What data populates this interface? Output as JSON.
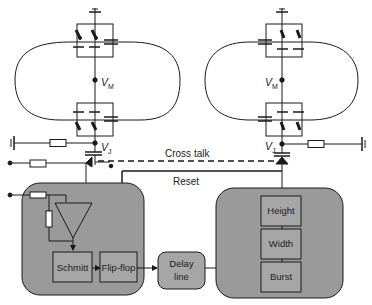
{
  "diagram": {
    "colors": {
      "line": "#1a1a1a",
      "panel_fill": "#9a9a9a",
      "block_fill": "#a6a6a6",
      "background": "#ffffff"
    },
    "loops": [
      {
        "id": "left",
        "node_mid_label": "V",
        "node_mid_sub": "M",
        "node_junction_label": "V",
        "node_junction_sub": "J"
      },
      {
        "id": "right",
        "node_mid_label": "V",
        "node_mid_sub": "M",
        "node_junction_label": "V",
        "node_junction_sub": "J"
      }
    ],
    "signals": {
      "cross_talk": "Cross talk",
      "reset": "Reset"
    },
    "blocks": {
      "schmitt": "Schmitt",
      "flip_flop": "Flip-flop",
      "delay_line_1": "Delay",
      "delay_line_2": "line",
      "height": "Height",
      "width": "Width",
      "burst": "Burst"
    }
  }
}
